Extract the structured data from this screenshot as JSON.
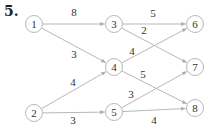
{
  "problem_number": "5.",
  "colors": {
    "edge": "#b8b8b8",
    "node_stroke": "#b8b8b8",
    "text": "#333333"
  },
  "nodes": [
    {
      "id": "1",
      "label": "1",
      "x": 34,
      "y": 24
    },
    {
      "id": "2",
      "label": "2",
      "x": 34,
      "y": 113
    },
    {
      "id": "3",
      "label": "3",
      "x": 114,
      "y": 24
    },
    {
      "id": "4",
      "label": "4",
      "x": 114,
      "y": 67
    },
    {
      "id": "5",
      "label": "5",
      "x": 114,
      "y": 112
    },
    {
      "id": "6",
      "label": "6",
      "x": 195,
      "y": 24
    },
    {
      "id": "7",
      "label": "7",
      "x": 195,
      "y": 67
    },
    {
      "id": "8",
      "label": "8",
      "x": 195,
      "y": 108
    }
  ],
  "edges": [
    {
      "from": "1",
      "to": "3",
      "weight": "8",
      "lx": 74,
      "ly": 16
    },
    {
      "from": "1",
      "to": "4",
      "weight": "3",
      "lx": 74,
      "ly": 58
    },
    {
      "from": "2",
      "to": "4",
      "weight": "4",
      "lx": 73,
      "ly": 86
    },
    {
      "from": "2",
      "to": "5",
      "weight": "3",
      "lx": 73,
      "ly": 124
    },
    {
      "from": "3",
      "to": "6",
      "weight": "5",
      "lx": 153,
      "ly": 17
    },
    {
      "from": "3",
      "to": "7",
      "weight": "2",
      "lx": 144,
      "ly": 34
    },
    {
      "from": "4",
      "to": "6",
      "weight": "4",
      "lx": 132,
      "ly": 55
    },
    {
      "from": "4",
      "to": "8",
      "weight": "5",
      "lx": 143,
      "ly": 78
    },
    {
      "from": "5",
      "to": "7",
      "weight": "3",
      "lx": 131,
      "ly": 98
    },
    {
      "from": "5",
      "to": "8",
      "weight": "4",
      "lx": 154,
      "ly": 124
    }
  ]
}
